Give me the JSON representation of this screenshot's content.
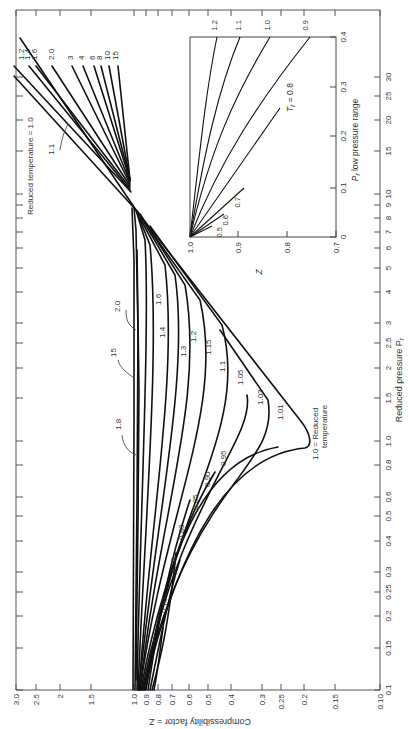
{
  "chart_data": [
    {
      "type": "line",
      "title": "Generalized compressibility chart",
      "orientation": "rotated 90deg clockwise (Z on bottom axis, Pr on right axis)",
      "xlabel": "Reduced pressure P_r",
      "ylabel": "Compressibility factor = Z",
      "x_scale": "log",
      "y_scale": "log",
      "xlim": [
        0.1,
        30
      ],
      "ylim": [
        0.1,
        3.0
      ],
      "x_ticks": [
        "0.1",
        "0.15",
        "0.2",
        "0.25",
        "0.3",
        "0.4",
        "0.5",
        "0.6",
        "0.8",
        "1.0",
        "1.5",
        "2",
        "2.5",
        "3",
        "4",
        "5",
        "6",
        "7",
        "8",
        "9",
        "10",
        "15",
        "20",
        "25",
        "30"
      ],
      "y_ticks": [
        "3.0",
        "2.5",
        "2",
        "1.5",
        "1.0",
        "0.9",
        "0.8",
        "0.7",
        "0.6",
        "0.5",
        "0.4",
        "0.3",
        "0.25",
        "0.2",
        "0.15",
        "0.10"
      ],
      "grid": false,
      "legend": "inline curve labels (reduced temperature Tr)",
      "series": [
        {
          "name": "Tr = 0.70",
          "x": [
            0.1,
            0.13,
            0.18
          ],
          "y": [
            0.93,
            0.88,
            0.82
          ]
        },
        {
          "name": "Tr = 0.75",
          "x": [
            0.1,
            0.2,
            0.35
          ],
          "y": [
            0.94,
            0.86,
            0.68
          ]
        },
        {
          "name": "Tr = 0.80",
          "x": [
            0.1,
            0.3,
            0.55
          ],
          "y": [
            0.95,
            0.82,
            0.57
          ]
        },
        {
          "name": "Tr = 0.85",
          "x": [
            0.1,
            0.4,
            0.75
          ],
          "y": [
            0.96,
            0.8,
            0.47
          ]
        },
        {
          "name": "Tr = 0.90",
          "x": [
            0.1,
            0.5,
            0.95
          ],
          "y": [
            0.97,
            0.8,
            0.38
          ]
        },
        {
          "name": "Tr = 0.95",
          "x": [
            0.1,
            0.6,
            1.0
          ],
          "y": [
            0.97,
            0.8,
            0.4
          ]
        },
        {
          "name": "Tr = 1.0",
          "x": [
            0.1,
            0.5,
            0.9,
            1.0,
            1.5,
            3,
            7,
            15,
            30
          ],
          "y": [
            0.98,
            0.85,
            0.62,
            0.2,
            0.3,
            0.5,
            0.95,
            1.6,
            2.8
          ]
        },
        {
          "name": "Tr = 1.01",
          "x": [
            0.1,
            0.8,
            1.1,
            1.3
          ],
          "y": [
            0.98,
            0.6,
            0.27,
            0.24
          ]
        },
        {
          "name": "Tr = 1.03",
          "x": [
            0.1,
            0.8,
            1.3,
            1.6
          ],
          "y": [
            0.98,
            0.62,
            0.32,
            0.27
          ]
        },
        {
          "name": "Tr = 1.05",
          "x": [
            0.1,
            1.0,
            1.6,
            2.5
          ],
          "y": [
            0.98,
            0.62,
            0.38,
            0.34
          ]
        },
        {
          "name": "Tr = 1.1",
          "x": [
            0.1,
            1.0,
            2.0,
            3,
            7,
            15,
            30
          ],
          "y": [
            0.99,
            0.72,
            0.48,
            0.5,
            0.95,
            1.55,
            2.6
          ]
        },
        {
          "name": "Tr = 1.15",
          "x": [
            0.1,
            1.5,
            2.5
          ],
          "y": [
            0.99,
            0.68,
            0.55
          ]
        },
        {
          "name": "Tr = 1.2",
          "x": [
            0.1,
            1.5,
            3,
            7,
            15,
            30
          ],
          "y": [
            0.99,
            0.75,
            0.6,
            0.96,
            1.45,
            2.4
          ]
        },
        {
          "name": "Tr = 1.3",
          "x": [
            0.1,
            2.0,
            3.5
          ],
          "y": [
            0.99,
            0.78,
            0.72
          ]
        },
        {
          "name": "Tr = 1.4",
          "x": [
            0.1,
            2.5,
            7,
            15,
            30
          ],
          "y": [
            0.99,
            0.82,
            0.96,
            1.35,
            2.1
          ]
        },
        {
          "name": "Tr = 1.6",
          "x": [
            0.1,
            3,
            7,
            15,
            30
          ],
          "y": [
            1.0,
            0.88,
            0.97,
            1.28,
            1.9
          ]
        },
        {
          "name": "Tr = 1.8",
          "x": [
            0.1,
            1.0,
            3,
            7
          ],
          "y": [
            1.0,
            0.97,
            0.93,
            0.98
          ]
        },
        {
          "name": "Tr = 2.0",
          "x": [
            0.1,
            2,
            7,
            15,
            30
          ],
          "y": [
            1.0,
            0.96,
            1.0,
            1.22,
            1.75
          ]
        },
        {
          "name": "Tr = 3",
          "x": [
            7,
            15,
            30
          ],
          "y": [
            1.02,
            1.15,
            1.45
          ]
        },
        {
          "name": "Tr = 4",
          "x": [
            7,
            15,
            30
          ],
          "y": [
            1.03,
            1.12,
            1.35
          ]
        },
        {
          "name": "Tr = 6",
          "x": [
            7,
            15,
            30
          ],
          "y": [
            1.03,
            1.09,
            1.25
          ]
        },
        {
          "name": "Tr = 8",
          "x": [
            7,
            15,
            30
          ],
          "y": [
            1.03,
            1.08,
            1.2
          ]
        },
        {
          "name": "Tr = 10",
          "x": [
            7,
            15,
            30
          ],
          "y": [
            1.03,
            1.07,
            1.16
          ]
        },
        {
          "name": "Tr = 15",
          "x": [
            0.1,
            2,
            7,
            15,
            30
          ],
          "y": [
            1.0,
            1.0,
            1.02,
            1.05,
            1.1
          ]
        }
      ],
      "annotations": [
        "Reduced temperature = 1.0",
        "1.0 = Reduced temperature",
        "1.1",
        "1.8",
        "15",
        "2.0"
      ]
    },
    {
      "type": "line",
      "title": "Inset: P_r low pressure range",
      "xlabel": "P_r low pressure range",
      "ylabel": "Z",
      "xlim": [
        0,
        0.4
      ],
      "ylim": [
        0.7,
        1.0
      ],
      "x_ticks": [
        "0",
        "0.1",
        "0.2",
        "0.3",
        "0.4"
      ],
      "y_ticks": [
        "1.0",
        "0.9",
        "0.8",
        "0.7"
      ],
      "series": [
        {
          "name": "Tr = 0.5",
          "x": [
            0,
            0.02
          ],
          "y": [
            1.0,
            0.955
          ]
        },
        {
          "name": "Tr = 0.6",
          "x": [
            0,
            0.045
          ],
          "y": [
            1.0,
            0.93
          ]
        },
        {
          "name": "Tr = 0.7",
          "x": [
            0,
            0.1
          ],
          "y": [
            1.0,
            0.89
          ]
        },
        {
          "name": "Tr = 0.8",
          "x": [
            0,
            0.26
          ],
          "y": [
            1.0,
            0.82
          ]
        },
        {
          "name": "Tr = 0.9",
          "x": [
            0,
            0.2,
            0.4
          ],
          "y": [
            1.0,
            0.92,
            0.85
          ]
        },
        {
          "name": "Tr = 1.0",
          "x": [
            0,
            0.2,
            0.4
          ],
          "y": [
            1.0,
            0.95,
            0.905
          ]
        },
        {
          "name": "Tr = 1.1",
          "x": [
            0,
            0.2,
            0.4
          ],
          "y": [
            1.0,
            0.965,
            0.94
          ]
        },
        {
          "name": "Tr = 1.2",
          "x": [
            0,
            0.2,
            0.4
          ],
          "y": [
            1.0,
            0.98,
            0.96
          ]
        }
      ]
    }
  ],
  "labels": {
    "x_axis_title": "Reduced pressure P",
    "x_axis_sub": "r",
    "y_axis_title": "Compressibility factor = Z",
    "inset_x_title": "P",
    "inset_x_sub": "r",
    "inset_x_rest": " low pressure range",
    "inset_y_title": "Z",
    "annotation_tr10_top": "Reduced temperature = 1.0",
    "annotation_tr10_bottom_1": "1.0 = Reduced",
    "annotation_tr10_bottom_2": "temperature",
    "annotation_tr08_prefix": "T",
    "annotation_tr08_sub": "r",
    "annotation_tr08_rest": " = 0.8"
  },
  "z_ticks": [
    {
      "label": "3.0",
      "x": 16
    },
    {
      "label": "2.5",
      "x": 36
    },
    {
      "label": "2",
      "x": 60
    },
    {
      "label": "1.5",
      "x": 91
    },
    {
      "label": "1.0",
      "x": 134
    },
    {
      "label": "0.9",
      "x": 146
    },
    {
      "label": "0.8",
      "x": 158
    },
    {
      "label": "0.7",
      "x": 172
    },
    {
      "label": "0.6",
      "x": 189
    },
    {
      "label": "0.5",
      "x": 208
    },
    {
      "label": "0.4",
      "x": 231
    },
    {
      "label": "0.3",
      "x": 262
    },
    {
      "label": "0.25",
      "x": 281
    },
    {
      "label": "0.2",
      "x": 304
    },
    {
      "label": "0.15",
      "x": 335
    },
    {
      "label": "0.10",
      "x": 380
    }
  ],
  "pr_ticks": [
    {
      "label": "0.1",
      "y": 690
    },
    {
      "label": "0.15",
      "y": 648
    },
    {
      "label": "0.2",
      "y": 616
    },
    {
      "label": "0.25",
      "y": 592
    },
    {
      "label": "0.3",
      "y": 572
    },
    {
      "label": "0.4",
      "y": 541
    },
    {
      "label": "0.5",
      "y": 516
    },
    {
      "label": "0.6",
      "y": 497
    },
    {
      "label": "0.8",
      "y": 465
    },
    {
      "label": "1.0",
      "y": 441
    },
    {
      "label": "1.5",
      "y": 398
    },
    {
      "label": "2",
      "y": 368
    },
    {
      "label": "2.5",
      "y": 343
    },
    {
      "label": "3",
      "y": 323
    },
    {
      "label": "4",
      "y": 292
    },
    {
      "label": "5",
      "y": 268
    },
    {
      "label": "6",
      "y": 248
    },
    {
      "label": "7",
      "y": 232
    },
    {
      "label": "8",
      "y": 218
    },
    {
      "label": "9",
      "y": 205
    },
    {
      "label": "10",
      "y": 194
    },
    {
      "label": "15",
      "y": 151
    },
    {
      "label": "20",
      "y": 120
    },
    {
      "label": "25",
      "y": 96
    },
    {
      "label": "30",
      "y": 77
    }
  ],
  "curve_labels": [
    {
      "text": "1.2",
      "x": 24,
      "y": 60
    },
    {
      "text": "1.4",
      "x": 30,
      "y": 60
    },
    {
      "text": "1.6",
      "x": 37,
      "y": 60
    },
    {
      "text": "2.0",
      "x": 54,
      "y": 60
    },
    {
      "text": "3",
      "x": 73,
      "y": 60
    },
    {
      "text": "4",
      "x": 84,
      "y": 60
    },
    {
      "text": "6",
      "x": 95,
      "y": 60
    },
    {
      "text": "8",
      "x": 102,
      "y": 60
    },
    {
      "text": "10",
      "x": 110,
      "y": 60
    },
    {
      "text": "15",
      "x": 118,
      "y": 60
    },
    {
      "text": "1.1",
      "x": 54,
      "y": 155
    },
    {
      "text": "2.0",
      "x": 120,
      "y": 312
    },
    {
      "text": "15",
      "x": 116,
      "y": 357
    },
    {
      "text": "1.8",
      "x": 121,
      "y": 430
    },
    {
      "text": "1.6",
      "x": 161,
      "y": 305
    },
    {
      "text": "1.4",
      "x": 165,
      "y": 338
    },
    {
      "text": "1.3",
      "x": 186,
      "y": 357
    },
    {
      "text": "1.2",
      "x": 196,
      "y": 342
    },
    {
      "text": "1.15",
      "x": 211,
      "y": 355
    },
    {
      "text": "1.1",
      "x": 225,
      "y": 372
    },
    {
      "text": "1.05",
      "x": 243,
      "y": 385
    },
    {
      "text": "1.03",
      "x": 263,
      "y": 405
    },
    {
      "text": "1.01",
      "x": 283,
      "y": 420
    },
    {
      "text": "0.95",
      "x": 226,
      "y": 466
    },
    {
      "text": "0.90",
      "x": 210,
      "y": 487
    },
    {
      "text": "0.85",
      "x": 198,
      "y": 510
    },
    {
      "text": "0.80",
      "x": 184,
      "y": 540
    },
    {
      "text": "0.75",
      "x": 176,
      "y": 573
    },
    {
      "text": "0.70",
      "x": 167,
      "y": 613
    }
  ],
  "inset_curve_labels": [
    {
      "text": "1.2",
      "x": 217,
      "y": 20
    },
    {
      "text": "1.1",
      "x": 241,
      "y": 20
    },
    {
      "text": "1.0",
      "x": 270,
      "y": 20
    },
    {
      "text": "0.9",
      "x": 308,
      "y": 20
    },
    {
      "text": "0.5",
      "x": 222,
      "y": 227
    },
    {
      "text": "0.6",
      "x": 228,
      "y": 215
    },
    {
      "text": "0.7",
      "x": 240,
      "y": 197
    }
  ],
  "inset_x_ticks": [
    {
      "label": "0",
      "y": 237
    },
    {
      "label": "0.1",
      "y": 188
    },
    {
      "label": "0.2",
      "y": 136
    },
    {
      "label": "0.3",
      "y": 87
    },
    {
      "label": "0.4",
      "y": 37
    }
  ],
  "inset_z_ticks": [
    {
      "label": "1.0",
      "x": 190
    },
    {
      "label": "0.9",
      "x": 238
    },
    {
      "label": "0.8",
      "x": 287
    },
    {
      "label": "0.7",
      "x": 336
    }
  ]
}
